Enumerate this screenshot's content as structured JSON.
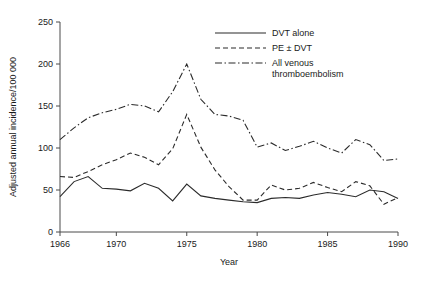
{
  "chart_data": {
    "type": "line",
    "title": "",
    "xlabel": "Year",
    "ylabel": "Adjusted annual incidence/100 000",
    "xlim": [
      1966,
      1990
    ],
    "ylim": [
      0,
      250
    ],
    "grid": false,
    "legend_position": "top-right",
    "xticks": [
      1966,
      1970,
      1975,
      1980,
      1985,
      1990
    ],
    "xtick_labels": [
      "1966",
      "1970",
      "1975",
      "1980",
      "1985",
      "1990"
    ],
    "yticks": [
      0,
      50,
      100,
      150,
      200,
      250
    ],
    "ytick_labels": [
      "0",
      "50",
      "100",
      "150",
      "200",
      "250"
    ],
    "x": [
      1966,
      1967,
      1968,
      1969,
      1970,
      1971,
      1972,
      1973,
      1974,
      1975,
      1976,
      1977,
      1978,
      1979,
      1980,
      1981,
      1982,
      1983,
      1984,
      1985,
      1986,
      1987,
      1988,
      1989,
      1990
    ],
    "series": [
      {
        "name": "DVT alone",
        "style": "solid",
        "values": [
          42,
          60,
          66,
          52,
          51,
          49,
          58,
          52,
          37,
          57,
          43,
          40,
          38,
          36,
          35,
          40,
          41,
          40,
          44,
          47,
          45,
          42,
          50,
          48,
          40
        ]
      },
      {
        "name": "PE ± DVT",
        "style": "dashed",
        "values": [
          66,
          65,
          72,
          80,
          86,
          94,
          89,
          80,
          99,
          140,
          101,
          74,
          54,
          38,
          38,
          56,
          50,
          52,
          59,
          53,
          48,
          60,
          55,
          33,
          41
        ]
      },
      {
        "name": "All venous thromboembolism",
        "style": "dashdot",
        "values": [
          110,
          124,
          136,
          142,
          146,
          152,
          150,
          143,
          167,
          200,
          158,
          140,
          138,
          133,
          101,
          106,
          97,
          102,
          108,
          100,
          94,
          110,
          104,
          85,
          87
        ]
      }
    ]
  },
  "legend": {
    "items": [
      {
        "label": "DVT alone",
        "style": "solid"
      },
      {
        "label": "PE ± DVT",
        "style": "dashed"
      },
      {
        "label": "All venous",
        "label2": "thromboembolism",
        "style": "dashdot"
      }
    ]
  },
  "colors": {
    "line": "#2b2b2b",
    "axis": "#4a4a4a",
    "text": "#1a1a1a",
    "background": "#ffffff"
  }
}
